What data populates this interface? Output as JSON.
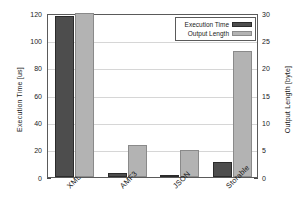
{
  "chart_data": {
    "type": "bar",
    "title": "",
    "xlabel": "",
    "categories": [
      "XML",
      "AMF3",
      "JSON",
      "Storable"
    ],
    "series": [
      {
        "name": "Execution Time",
        "axis": "left",
        "unit": "us",
        "color": "#4d4d4d",
        "values": [
          118,
          3,
          1.3,
          11
        ]
      },
      {
        "name": "Output Length",
        "axis": "right",
        "unit": "byte",
        "color": "#b3b3b3",
        "values": [
          30,
          5.9,
          4.9,
          23
        ]
      }
    ],
    "left_axis": {
      "label": "Execution Time [us]",
      "ticks": [
        0,
        20,
        40,
        60,
        80,
        100,
        120
      ],
      "ylim": [
        0,
        120
      ]
    },
    "right_axis": {
      "label": "Output Length [byte]",
      "ticks": [
        0,
        5,
        10,
        15,
        20,
        25,
        30
      ],
      "ylim": [
        0,
        30
      ]
    },
    "grid": true,
    "legend": {
      "position": "top-right",
      "entries": [
        "Execution Time",
        "Output Length"
      ]
    }
  }
}
